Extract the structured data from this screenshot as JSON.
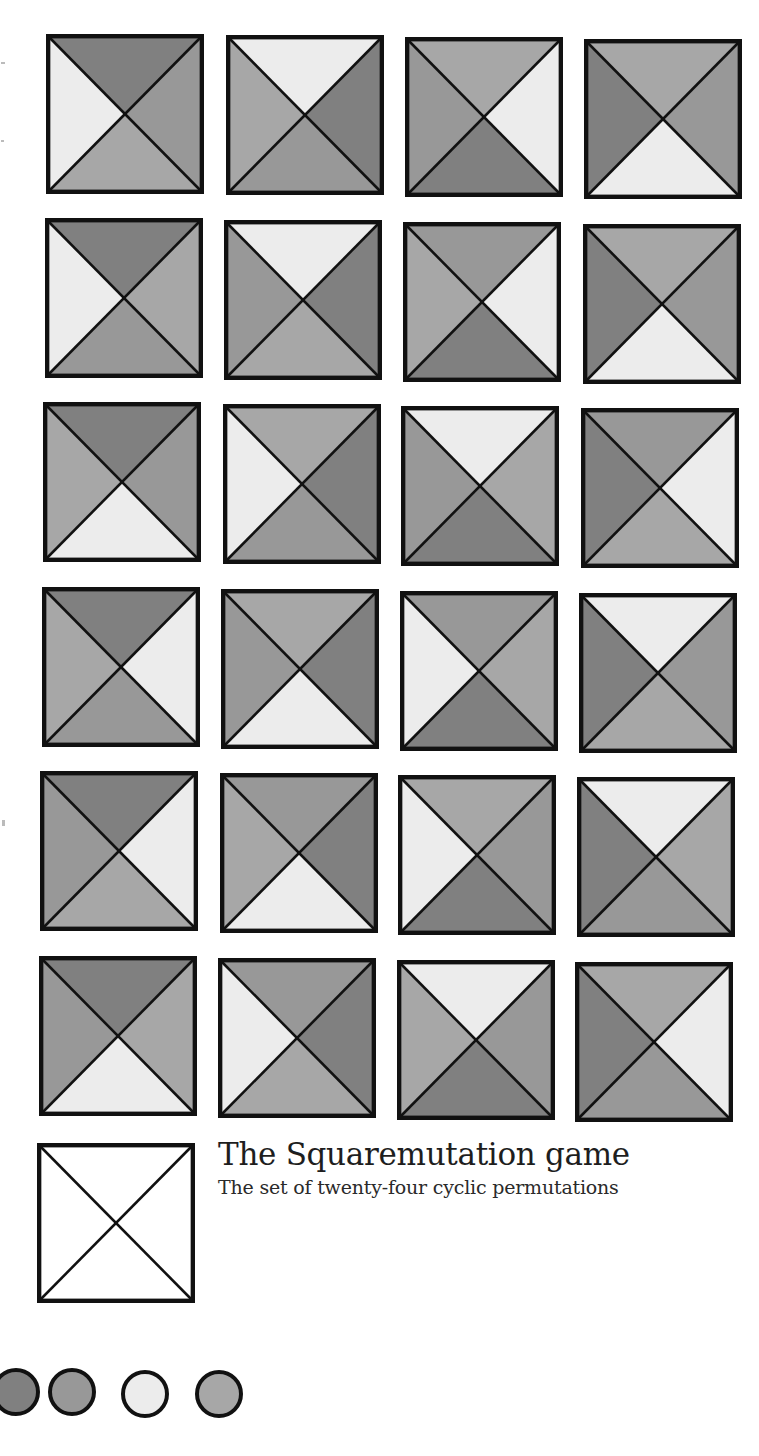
{
  "title": "The Squaremutation game",
  "subtitle": "The set of twenty-four cyclic permutations",
  "palette": {
    "D": "#808080",
    "M": "#989898",
    "N": "#a7a7a7",
    "L": "#ececec",
    "blank": "#ffffff",
    "stroke": "#111111"
  },
  "swatches": [
    "D",
    "M",
    "L",
    "N"
  ],
  "grid": {
    "rows": 6,
    "cols": 4,
    "tiles": [
      {
        "row": 0,
        "col": 0,
        "x": 46,
        "y": 34,
        "top": "D",
        "right": "M",
        "bottom": "N",
        "left": "L"
      },
      {
        "row": 0,
        "col": 1,
        "x": 226,
        "y": 35,
        "top": "L",
        "right": "D",
        "bottom": "M",
        "left": "N"
      },
      {
        "row": 0,
        "col": 2,
        "x": 405,
        "y": 37,
        "top": "N",
        "right": "L",
        "bottom": "D",
        "left": "M"
      },
      {
        "row": 0,
        "col": 3,
        "x": 584,
        "y": 39,
        "top": "N",
        "right": "M",
        "bottom": "L",
        "left": "D"
      },
      {
        "row": 1,
        "col": 0,
        "x": 45,
        "y": 218,
        "top": "D",
        "right": "N",
        "bottom": "M",
        "left": "L"
      },
      {
        "row": 1,
        "col": 1,
        "x": 224,
        "y": 220,
        "top": "L",
        "right": "D",
        "bottom": "N",
        "left": "M"
      },
      {
        "row": 1,
        "col": 2,
        "x": 403,
        "y": 222,
        "top": "M",
        "right": "L",
        "bottom": "D",
        "left": "N"
      },
      {
        "row": 1,
        "col": 3,
        "x": 583,
        "y": 224,
        "top": "N",
        "right": "M",
        "bottom": "L",
        "left": "D"
      },
      {
        "row": 2,
        "col": 0,
        "x": 43,
        "y": 402,
        "top": "D",
        "right": "M",
        "bottom": "L",
        "left": "N"
      },
      {
        "row": 2,
        "col": 1,
        "x": 223,
        "y": 404,
        "top": "N",
        "right": "D",
        "bottom": "M",
        "left": "L"
      },
      {
        "row": 2,
        "col": 2,
        "x": 401,
        "y": 406,
        "top": "L",
        "right": "N",
        "bottom": "D",
        "left": "M"
      },
      {
        "row": 2,
        "col": 3,
        "x": 581,
        "y": 408,
        "top": "M",
        "right": "L",
        "bottom": "N",
        "left": "D"
      },
      {
        "row": 3,
        "col": 0,
        "x": 42,
        "y": 587,
        "top": "D",
        "right": "L",
        "bottom": "M",
        "left": "N"
      },
      {
        "row": 3,
        "col": 1,
        "x": 221,
        "y": 589,
        "top": "N",
        "right": "D",
        "bottom": "L",
        "left": "M"
      },
      {
        "row": 3,
        "col": 2,
        "x": 400,
        "y": 591,
        "top": "M",
        "right": "N",
        "bottom": "D",
        "left": "L"
      },
      {
        "row": 3,
        "col": 3,
        "x": 579,
        "y": 593,
        "top": "L",
        "right": "M",
        "bottom": "N",
        "left": "D"
      },
      {
        "row": 4,
        "col": 0,
        "x": 40,
        "y": 771,
        "top": "D",
        "right": "L",
        "bottom": "N",
        "left": "M"
      },
      {
        "row": 4,
        "col": 1,
        "x": 220,
        "y": 773,
        "top": "M",
        "right": "D",
        "bottom": "L",
        "left": "N"
      },
      {
        "row": 4,
        "col": 2,
        "x": 398,
        "y": 775,
        "top": "N",
        "right": "M",
        "bottom": "D",
        "left": "L"
      },
      {
        "row": 4,
        "col": 3,
        "x": 577,
        "y": 777,
        "top": "L",
        "right": "N",
        "bottom": "M",
        "left": "D"
      },
      {
        "row": 5,
        "col": 0,
        "x": 39,
        "y": 956,
        "top": "D",
        "right": "N",
        "bottom": "L",
        "left": "M"
      },
      {
        "row": 5,
        "col": 1,
        "x": 218,
        "y": 958,
        "top": "M",
        "right": "D",
        "bottom": "N",
        "left": "L"
      },
      {
        "row": 5,
        "col": 2,
        "x": 397,
        "y": 960,
        "top": "L",
        "right": "M",
        "bottom": "D",
        "left": "N"
      },
      {
        "row": 5,
        "col": 3,
        "x": 575,
        "y": 962,
        "top": "N",
        "right": "L",
        "bottom": "M",
        "left": "D"
      }
    ],
    "blank_tile": {
      "x": 37,
      "y": 1143,
      "top": "blank",
      "right": "blank",
      "bottom": "blank",
      "left": "blank"
    }
  },
  "legend_swatches": [
    {
      "x": -8,
      "y": 1368,
      "color": "D"
    },
    {
      "x": 48,
      "y": 1368,
      "color": "M"
    },
    {
      "x": 121,
      "y": 1370,
      "color": "L"
    },
    {
      "x": 195,
      "y": 1370,
      "color": "N"
    }
  ]
}
